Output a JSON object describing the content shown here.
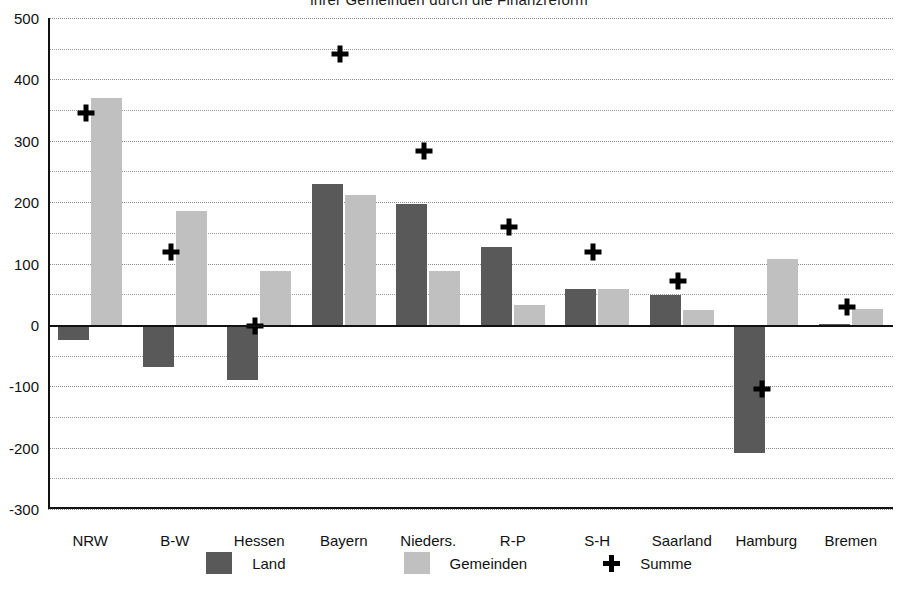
{
  "chart_data": {
    "type": "bar",
    "title": "ihrer Gemeinden durch die Finanzreform",
    "xlabel": "",
    "ylabel": "",
    "ylim": [
      -300,
      500
    ],
    "ytick_step": 100,
    "gridline_step": 50,
    "grid": true,
    "legend_position": "bottom",
    "categories": [
      "NRW",
      "B-W",
      "Hessen",
      "Bayern",
      "Nieders.",
      "R-P",
      "S-H",
      "Saarland",
      "Hamburg",
      "Bremen"
    ],
    "series": [
      {
        "name": "Land",
        "type": "bar",
        "color": "#595959",
        "values": [
          -25,
          -68,
          -90,
          230,
          197,
          127,
          59,
          49,
          -208,
          2
        ]
      },
      {
        "name": "Gemeinden",
        "type": "bar",
        "color": "#c0c0c0",
        "values": [
          370,
          186,
          88,
          211,
          87,
          32,
          58,
          24,
          108,
          26
        ]
      },
      {
        "name": "Summe",
        "type": "scatter",
        "marker": "plus",
        "color": "#000000",
        "values": [
          345,
          118,
          -2,
          441,
          283,
          159,
          118,
          71,
          -104,
          29
        ]
      }
    ],
    "ytick_labels": [
      "500",
      "400",
      "300",
      "200",
      "100",
      "0",
      "-100",
      "-200",
      "-300"
    ],
    "ytick_values": [
      500,
      400,
      300,
      200,
      100,
      0,
      -100,
      -200,
      -300
    ]
  },
  "legend": {
    "entries": [
      {
        "label": "Land",
        "swatch": "dark-gray-swatch"
      },
      {
        "label": "Gemeinden",
        "swatch": "light-gray-swatch"
      },
      {
        "label": "Summe",
        "swatch": "plus-marker"
      }
    ]
  },
  "colors": {
    "land": "#595959",
    "gemeinden": "#c0c0c0",
    "summe": "#000000",
    "axis": "#111111",
    "gridline": "#9a9a9a",
    "background": "#ffffff"
  }
}
